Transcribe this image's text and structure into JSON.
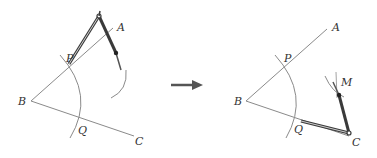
{
  "figure": {
    "colors": {
      "ray": "#8a8a8a",
      "arc": "#8a8a8a",
      "compass": "#3a3a3a",
      "arrow": "#555555",
      "label": "#333333"
    },
    "left_panel": {
      "labels": {
        "A": "A",
        "B": "B",
        "P": "P",
        "Q": "Q",
        "C": "C"
      }
    },
    "arrow": {
      "direction": "right"
    },
    "right_panel": {
      "labels": {
        "A": "A",
        "B": "B",
        "P": "P",
        "Q": "Q",
        "C": "C",
        "M": "M"
      }
    }
  }
}
